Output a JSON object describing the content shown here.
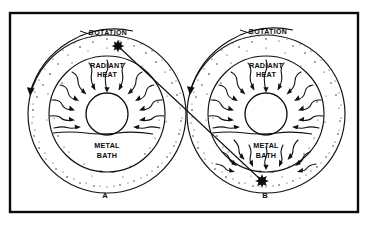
{
  "figure": {
    "background_color": "#ffffff",
    "ink_color": "#101010",
    "frame": {
      "x": 10,
      "y": 13,
      "width": 348,
      "height": 199,
      "stroke_width": 2.4
    }
  },
  "panels": [
    {
      "id": "A",
      "label": "A",
      "label_x": 105,
      "label_y": 196,
      "center_x": 107,
      "center_y": 114,
      "outer_radius": 79,
      "inner_radius": 58,
      "core_radius": 21,
      "rotation": {
        "label": "ROTATION",
        "label_x": 108,
        "label_y": 33,
        "direction": "counterclockwise",
        "arc_radius": 88,
        "arrow_end_x": 30,
        "arrow_end_y": 93
      },
      "radiant_heat": {
        "label_line_1": "RADIANT",
        "label_line_2": "HEAT",
        "label_x": 107,
        "label_y": 70,
        "arrow_direction": "inward",
        "arrow_count": 13
      },
      "metal_bath": {
        "label_line_1": "METAL",
        "label_line_2": "BATH",
        "label_x": 107,
        "label_y": 150,
        "surface_y": 133
      },
      "burst_marker": {
        "x": 118,
        "y": 46,
        "radius": 4.6,
        "position": "top"
      }
    },
    {
      "id": "B",
      "label": "B",
      "label_x": 265,
      "label_y": 196,
      "center_x": 266,
      "center_y": 114,
      "outer_radius": 79,
      "inner_radius": 58,
      "core_radius": 21,
      "rotation": {
        "label": "ROTATION",
        "label_x": 268,
        "label_y": 32,
        "direction": "counterclockwise",
        "arc_radius": 88,
        "arrow_end_x": 190,
        "arrow_end_y": 92
      },
      "radiant_heat": {
        "label_line_1": "RADIANT",
        "label_line_2": "HEAT",
        "label_x": 266,
        "label_y": 70,
        "arrow_direction": "inward",
        "arrow_count": 13
      },
      "metal_bath": {
        "label_line_1": "METAL",
        "label_line_2": "BATH",
        "label_x": 266,
        "label_y": 150,
        "surface_y": 133
      },
      "lower_arrows": {
        "direction": "toward-burst",
        "arrow_count": 9
      },
      "burst_marker": {
        "x": 262,
        "y": 181,
        "radius": 4.8,
        "position": "bottom"
      }
    }
  ],
  "connector": {
    "name": "burst-link-line",
    "from_x": 120,
    "from_y": 48,
    "to_x": 260,
    "to_y": 179
  }
}
